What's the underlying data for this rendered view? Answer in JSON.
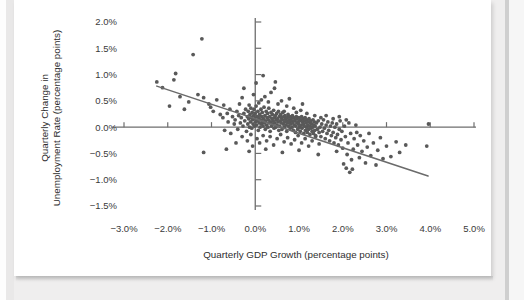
{
  "figure": {
    "background_color": "#ffffff",
    "page_background_color": "#efeeee"
  },
  "chart_data": {
    "type": "scatter",
    "title": "",
    "xlabel": "Quarterly GDP Growth (percentage points)",
    "ylabel": "Quarterly Change in Unemployment Rate (percentage points)",
    "ylabel_line1": "Quarterly Change in",
    "ylabel_line2": "Unemployment Rate (percentage points)",
    "xlim": [
      -3.6,
      5.6
    ],
    "ylim": [
      -1.75,
      2.25
    ],
    "xticks": [
      -3.0,
      -2.0,
      -1.0,
      0.0,
      1.0,
      2.0,
      3.0,
      4.0,
      5.0
    ],
    "xtick_labels": [
      "−3.0%",
      "−2.0%",
      "−1.0%",
      "0.0%",
      "1.0%",
      "2.0%",
      "3.0%",
      "4.0%",
      "5.0%"
    ],
    "yticks": [
      2.0,
      1.5,
      1.0,
      0.5,
      0.0,
      -0.5,
      -1.0,
      -1.5
    ],
    "ytick_labels": [
      "2.0%",
      "1.5%",
      "1.0%",
      "0.5%",
      "0.0%",
      "−0.5%",
      "−1.0%",
      "−1.5%"
    ],
    "grid": false,
    "legend": null,
    "axis_color": "#6e6e6e",
    "point_color": "#595959",
    "point_radius": 1.9,
    "trendline": {
      "color": "#6b6b6b",
      "width": 1.5,
      "x_start": -2.25,
      "y_start": 0.78,
      "x_end": 3.95,
      "y_end": -0.93
    },
    "points": [
      [
        -2.25,
        0.86
      ],
      [
        -2.12,
        0.75
      ],
      [
        -1.82,
        1.02
      ],
      [
        -1.86,
        0.9
      ],
      [
        -1.72,
        0.58
      ],
      [
        -1.52,
        0.48
      ],
      [
        -1.42,
        1.38
      ],
      [
        -1.22,
        1.68
      ],
      [
        -1.31,
        0.62
      ],
      [
        -1.18,
        0.56
      ],
      [
        -1.06,
        0.44
      ],
      [
        -1.02,
        0.38
      ],
      [
        -0.96,
        0.3
      ],
      [
        -0.88,
        0.52
      ],
      [
        -0.8,
        0.24
      ],
      [
        -0.74,
        0.18
      ],
      [
        -0.72,
        0.42
      ],
      [
        -0.64,
        0.26
      ],
      [
        -0.62,
        0.1
      ],
      [
        -0.58,
        0.34
      ],
      [
        -0.52,
        0.2
      ],
      [
        -0.48,
        0.06
      ],
      [
        -0.46,
        0.14
      ],
      [
        -0.42,
        0.3
      ],
      [
        -0.4,
        -0.04
      ],
      [
        -0.38,
        0.22
      ],
      [
        -0.36,
        0.44
      ],
      [
        -0.34,
        0.08
      ],
      [
        -0.32,
        0.18
      ],
      [
        -0.3,
        0.56
      ],
      [
        -0.28,
        0.02
      ],
      [
        -0.26,
        0.26
      ],
      [
        -0.24,
        0.12
      ],
      [
        -0.22,
        0.34
      ],
      [
        -0.2,
        -0.08
      ],
      [
        -0.18,
        0.2
      ],
      [
        -0.17,
        0.06
      ],
      [
        -0.16,
        0.3
      ],
      [
        -0.15,
        0.16
      ],
      [
        -0.14,
        0.42
      ],
      [
        -0.13,
        0.0
      ],
      [
        -0.12,
        0.24
      ],
      [
        -0.11,
        0.1
      ],
      [
        -0.1,
        0.36
      ],
      [
        -0.09,
        0.18
      ],
      [
        -0.08,
        -0.02
      ],
      [
        -0.07,
        0.28
      ],
      [
        -0.06,
        0.14
      ],
      [
        -0.05,
        0.06
      ],
      [
        -0.04,
        0.22
      ],
      [
        -0.03,
        0.34
      ],
      [
        -0.02,
        0.02
      ],
      [
        -0.01,
        0.16
      ],
      [
        0.0,
        0.26
      ],
      [
        0.01,
        0.1
      ],
      [
        0.02,
        0.4
      ],
      [
        0.03,
        0.04
      ],
      [
        0.04,
        0.2
      ],
      [
        0.05,
        0.12
      ],
      [
        0.06,
        0.3
      ],
      [
        0.07,
        -0.06
      ],
      [
        0.08,
        0.18
      ],
      [
        0.09,
        0.08
      ],
      [
        0.1,
        0.24
      ],
      [
        0.11,
        0.0
      ],
      [
        0.12,
        0.14
      ],
      [
        0.13,
        0.34
      ],
      [
        0.14,
        0.06
      ],
      [
        0.15,
        0.2
      ],
      [
        0.16,
        0.28
      ],
      [
        0.17,
        0.1
      ],
      [
        0.18,
        0.02
      ],
      [
        0.19,
        0.16
      ],
      [
        0.2,
        0.38
      ],
      [
        0.21,
        0.08
      ],
      [
        0.22,
        0.22
      ],
      [
        0.23,
        -0.04
      ],
      [
        0.24,
        0.12
      ],
      [
        0.25,
        0.3
      ],
      [
        0.26,
        0.04
      ],
      [
        0.27,
        0.18
      ],
      [
        0.28,
        0.26
      ],
      [
        0.29,
        0.0
      ],
      [
        0.3,
        0.14
      ],
      [
        0.31,
        0.36
      ],
      [
        0.32,
        0.08
      ],
      [
        0.33,
        0.2
      ],
      [
        0.34,
        -0.08
      ],
      [
        0.35,
        0.1
      ],
      [
        0.36,
        0.28
      ],
      [
        0.37,
        0.02
      ],
      [
        0.38,
        0.16
      ],
      [
        0.39,
        0.24
      ],
      [
        0.4,
        0.06
      ],
      [
        0.41,
        0.12
      ],
      [
        0.42,
        0.32
      ],
      [
        0.43,
        -0.02
      ],
      [
        0.44,
        0.18
      ],
      [
        0.45,
        0.08
      ],
      [
        0.46,
        0.22
      ],
      [
        0.47,
        0.0
      ],
      [
        0.48,
        0.14
      ],
      [
        0.49,
        0.26
      ],
      [
        0.5,
        0.04
      ],
      [
        0.51,
        0.16
      ],
      [
        0.52,
        0.1
      ],
      [
        0.53,
        0.3
      ],
      [
        0.54,
        -0.06
      ],
      [
        0.55,
        0.2
      ],
      [
        0.56,
        0.02
      ],
      [
        0.57,
        0.12
      ],
      [
        0.58,
        0.24
      ],
      [
        0.59,
        0.08
      ],
      [
        0.6,
        0.18
      ],
      [
        0.61,
        -0.04
      ],
      [
        0.62,
        0.14
      ],
      [
        0.63,
        0.28
      ],
      [
        0.64,
        0.06
      ],
      [
        0.65,
        0.2
      ],
      [
        0.66,
        0.0
      ],
      [
        0.67,
        0.1
      ],
      [
        0.68,
        0.22
      ],
      [
        0.69,
        0.16
      ],
      [
        0.7,
        0.04
      ],
      [
        0.71,
        0.12
      ],
      [
        0.72,
        -0.08
      ],
      [
        0.73,
        0.18
      ],
      [
        0.74,
        0.08
      ],
      [
        0.75,
        0.24
      ],
      [
        0.76,
        0.02
      ],
      [
        0.77,
        0.14
      ],
      [
        0.78,
        0.1
      ],
      [
        0.79,
        0.2
      ],
      [
        0.8,
        -0.02
      ],
      [
        0.81,
        0.06
      ],
      [
        0.82,
        0.16
      ],
      [
        0.83,
        0.12
      ],
      [
        0.84,
        0.0
      ],
      [
        0.85,
        0.22
      ],
      [
        0.86,
        0.08
      ],
      [
        0.87,
        -0.06
      ],
      [
        0.88,
        0.18
      ],
      [
        0.89,
        0.04
      ],
      [
        0.9,
        0.12
      ],
      [
        0.91,
        0.14
      ],
      [
        0.92,
        -0.1
      ],
      [
        0.93,
        0.02
      ],
      [
        0.94,
        0.2
      ],
      [
        0.95,
        0.08
      ],
      [
        0.96,
        0.16
      ],
      [
        0.97,
        -0.04
      ],
      [
        0.98,
        0.1
      ],
      [
        0.99,
        0.06
      ],
      [
        1.0,
        0.18
      ],
      [
        1.01,
        0.0
      ],
      [
        1.02,
        0.12
      ],
      [
        1.03,
        -0.08
      ],
      [
        1.04,
        0.14
      ],
      [
        1.05,
        0.04
      ],
      [
        1.06,
        0.2
      ],
      [
        1.07,
        -0.02
      ],
      [
        1.08,
        0.1
      ],
      [
        1.09,
        0.16
      ],
      [
        1.1,
        0.06
      ],
      [
        1.11,
        -0.12
      ],
      [
        1.12,
        0.02
      ],
      [
        1.13,
        0.12
      ],
      [
        1.14,
        0.18
      ],
      [
        1.15,
        -0.06
      ],
      [
        1.16,
        0.08
      ],
      [
        1.17,
        0.0
      ],
      [
        1.18,
        0.14
      ],
      [
        1.19,
        -0.1
      ],
      [
        1.2,
        0.04
      ],
      [
        1.21,
        0.1
      ],
      [
        1.22,
        -0.04
      ],
      [
        1.23,
        0.16
      ],
      [
        1.24,
        0.02
      ],
      [
        1.25,
        -0.14
      ],
      [
        1.26,
        0.08
      ],
      [
        1.27,
        0.12
      ],
      [
        1.28,
        -0.02
      ],
      [
        1.29,
        0.06
      ],
      [
        1.3,
        -0.08
      ],
      [
        1.31,
        0.0
      ],
      [
        1.32,
        0.14
      ],
      [
        1.33,
        -0.12
      ],
      [
        1.34,
        0.04
      ],
      [
        1.35,
        0.1
      ],
      [
        1.36,
        -0.06
      ],
      [
        1.37,
        0.02
      ],
      [
        1.38,
        -0.16
      ],
      [
        1.4,
        0.08
      ],
      [
        1.42,
        -0.04
      ],
      [
        1.44,
        0.12
      ],
      [
        1.46,
        -0.1
      ],
      [
        1.48,
        0.0
      ],
      [
        1.5,
        -0.18
      ],
      [
        1.52,
        0.06
      ],
      [
        1.54,
        -0.08
      ],
      [
        1.56,
        0.14
      ],
      [
        1.58,
        -0.02
      ],
      [
        1.6,
        -0.22
      ],
      [
        1.62,
        0.04
      ],
      [
        1.64,
        -0.12
      ],
      [
        1.66,
        0.1
      ],
      [
        1.68,
        -0.06
      ],
      [
        1.7,
        -0.26
      ],
      [
        1.72,
        0.02
      ],
      [
        1.74,
        -0.16
      ],
      [
        1.76,
        0.08
      ],
      [
        1.78,
        -0.1
      ],
      [
        1.8,
        -0.3
      ],
      [
        1.82,
        0.0
      ],
      [
        1.84,
        -0.2
      ],
      [
        1.86,
        0.06
      ],
      [
        1.88,
        -0.14
      ],
      [
        1.9,
        -0.34
      ],
      [
        1.92,
        -0.04
      ],
      [
        1.94,
        0.12
      ],
      [
        1.96,
        -0.24
      ],
      [
        1.98,
        -0.08
      ],
      [
        2.0,
        -0.4
      ],
      [
        2.04,
        0.02
      ],
      [
        2.06,
        -0.18
      ],
      [
        2.1,
        -0.52
      ],
      [
        2.12,
        -0.3
      ],
      [
        2.14,
        0.08
      ],
      [
        2.18,
        -0.12
      ],
      [
        2.2,
        -0.62
      ],
      [
        2.24,
        -0.42
      ],
      [
        2.26,
        -0.22
      ],
      [
        2.3,
        0.04
      ],
      [
        2.34,
        -0.34
      ],
      [
        2.38,
        -0.58
      ],
      [
        2.4,
        -0.16
      ],
      [
        2.44,
        -0.46
      ],
      [
        2.48,
        -0.26
      ],
      [
        2.52,
        -0.68
      ],
      [
        2.56,
        -0.38
      ],
      [
        2.6,
        -0.12
      ],
      [
        2.64,
        -0.54
      ],
      [
        2.7,
        -0.3
      ],
      [
        2.76,
        -0.72
      ],
      [
        2.8,
        -0.44
      ],
      [
        2.86,
        -0.2
      ],
      [
        2.92,
        -0.6
      ],
      [
        3.0,
        -0.36
      ],
      [
        3.1,
        -0.56
      ],
      [
        3.22,
        -0.28
      ],
      [
        3.3,
        -0.48
      ],
      [
        3.44,
        -0.34
      ],
      [
        3.92,
        -0.36
      ],
      [
        3.96,
        0.06
      ],
      [
        -0.44,
        -0.3
      ],
      [
        -0.3,
        -0.18
      ],
      [
        -0.18,
        -0.26
      ],
      [
        -0.1,
        -0.14
      ],
      [
        -0.06,
        -0.36
      ],
      [
        0.04,
        -0.22
      ],
      [
        0.1,
        -0.3
      ],
      [
        0.18,
        -0.16
      ],
      [
        0.26,
        -0.26
      ],
      [
        0.34,
        -0.18
      ],
      [
        0.42,
        -0.34
      ],
      [
        0.5,
        -0.22
      ],
      [
        0.58,
        -0.14
      ],
      [
        0.66,
        -0.28
      ],
      [
        0.74,
        -0.2
      ],
      [
        0.82,
        -0.32
      ],
      [
        0.9,
        -0.24
      ],
      [
        0.98,
        -0.16
      ],
      [
        1.06,
        -0.3
      ],
      [
        1.14,
        -0.22
      ],
      [
        1.22,
        -0.36
      ],
      [
        1.3,
        -0.26
      ],
      [
        1.38,
        -0.18
      ],
      [
        1.46,
        -0.32
      ],
      [
        -1.18,
        -0.48
      ],
      [
        -0.7,
        -0.06
      ],
      [
        -0.56,
        -0.12
      ],
      [
        0.08,
        0.46
      ],
      [
        0.3,
        0.48
      ],
      [
        0.52,
        0.44
      ],
      [
        0.14,
        0.52
      ],
      [
        0.22,
        0.58
      ],
      [
        0.36,
        0.66
      ],
      [
        0.44,
        0.74
      ],
      [
        0.6,
        0.5
      ],
      [
        0.72,
        0.4
      ],
      [
        0.88,
        0.36
      ],
      [
        1.04,
        0.32
      ],
      [
        1.18,
        0.26
      ],
      [
        1.36,
        0.22
      ],
      [
        0.02,
        0.84
      ],
      [
        0.18,
        0.98
      ],
      [
        0.46,
        0.86
      ],
      [
        -0.04,
        0.62
      ],
      [
        -0.26,
        0.74
      ],
      [
        0.66,
        0.3
      ],
      [
        0.94,
        0.28
      ],
      [
        1.5,
        0.18
      ],
      [
        1.62,
        0.22
      ],
      [
        1.78,
        0.16
      ],
      [
        1.92,
        0.2
      ],
      [
        2.08,
        0.14
      ],
      [
        -1.62,
        0.34
      ],
      [
        -1.96,
        0.4
      ],
      [
        0.78,
        0.54
      ],
      [
        1.08,
        0.44
      ],
      [
        -0.66,
        -0.42
      ],
      [
        -0.14,
        -0.46
      ],
      [
        0.24,
        -0.42
      ],
      [
        0.62,
        -0.48
      ],
      [
        1.0,
        -0.44
      ],
      [
        1.44,
        -0.52
      ],
      [
        1.86,
        -0.46
      ],
      [
        2.32,
        -0.1
      ],
      [
        2.02,
        -0.7
      ],
      [
        2.22,
        -0.8
      ],
      [
        2.16,
        -0.86
      ],
      [
        2.08,
        -0.78
      ]
    ]
  }
}
